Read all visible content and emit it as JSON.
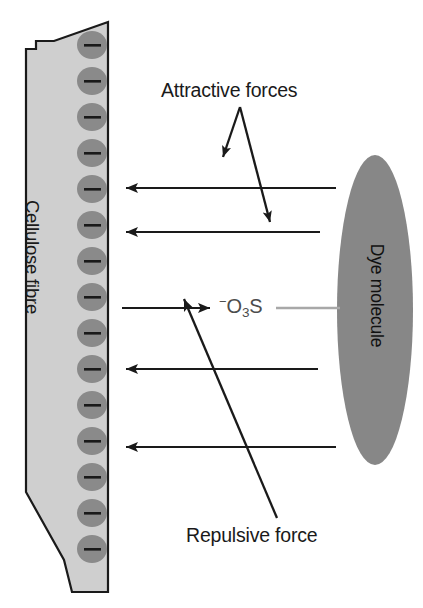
{
  "diagram": {
    "title_visible": false,
    "labels": {
      "attractive_forces": "Attractive forces",
      "repulsive_force": "Repulsive force",
      "cellulose_fibre": "Cellulose fibre",
      "dye_molecule": "Dye molecule",
      "sulfonate_minus": "−",
      "sulfonate_o": "O",
      "sulfonate_three": "3",
      "sulfonate_s": "S"
    },
    "charges": {
      "symbol": "–",
      "count": 15,
      "fill_color": "#8a8a8a",
      "symbol_color": "#1a1a1a",
      "positions_y": [
        45,
        81,
        117,
        153,
        189,
        225,
        261,
        297,
        333,
        369,
        405,
        441,
        477,
        513,
        549
      ],
      "center_x": 92,
      "radius_x": 15,
      "radius_y": 14
    },
    "fibre": {
      "fill_color": "#cfcfcf",
      "stroke_color": "#1a1a1a",
      "outline_points": "108,22 108,592 72,592 64,560 26,492 26,49 36,49 36,41 54,41"
    },
    "dye": {
      "fill_color": "#878787",
      "center_x": 375,
      "center_y": 310,
      "radius_x": 38,
      "radius_y": 155
    },
    "connector": {
      "color": "#a8a8a8",
      "x1": 276,
      "x2": 338,
      "y": 308
    },
    "attractive_arrows": [
      {
        "name": "attractive-arrow-1",
        "x_start": 336,
        "x_end": 124,
        "y": 188
      },
      {
        "name": "attractive-arrow-2",
        "x_start": 320,
        "x_end": 124,
        "y": 232
      },
      {
        "name": "attractive-arrow-3",
        "x_start": 318,
        "x_end": 124,
        "y": 369
      },
      {
        "name": "attractive-arrow-4",
        "x_start": 336,
        "x_end": 124,
        "y": 447
      }
    ],
    "repulsive_arrows": [
      {
        "name": "repulsive-arrow-horizontal",
        "x_start": 122,
        "x_end": 212,
        "y": 308,
        "direction": "right"
      },
      {
        "name": "repulsive-arrow-diagonal",
        "x_start": 277,
        "y_start": 518,
        "x_end": 182,
        "y_end": 296,
        "direction": "up-left"
      }
    ],
    "pointer_arrows": [
      {
        "name": "attractive-pointer-left",
        "x_start": 240,
        "y_start": 106,
        "x_end": 224,
        "y_end": 160
      },
      {
        "name": "attractive-pointer-right",
        "x_start": 240,
        "y_start": 106,
        "x_end": 272,
        "y_end": 225
      }
    ],
    "colors": {
      "ink": "#1a1a1a",
      "fibre_fill": "#cfcfcf",
      "charge_fill": "#8a8a8a",
      "dye_fill": "#878787",
      "connector_gray": "#a8a8a8",
      "background": "#ffffff"
    }
  }
}
